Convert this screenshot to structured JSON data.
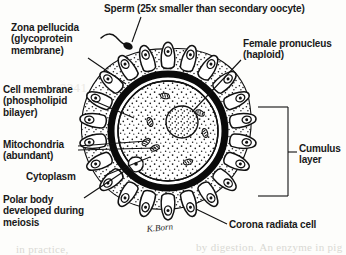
{
  "figure": {
    "background_color": "#fdfdfb",
    "ink_color": "#191919",
    "signature": "K.Born"
  },
  "labels": {
    "sperm": "Sperm (25x smaller than secondary oocyte)",
    "zona_pellucida": "Zona pellucida\n(glycoprotein\nmembrane)",
    "female_pronucleus": "Female pronucleus\n(haploid)",
    "cell_membrane": "Cell membrane\n(phospholipid\nbilayer)",
    "mitochondria": "Mitochondria\n(abundant)",
    "cytoplasm": "Cytoplasm",
    "polar_body": "Polar body\ndeveloped during\nmeiosis",
    "cumulus_layer": "Cumulus\nlayer",
    "corona_radiata": "Corona radiata cell"
  },
  "bleed_through": {
    "line_a": "in practice,",
    "line_b": "by digestion. An enzyme in pig the C4C 2005",
    "line_c": "2241"
  },
  "structures": {
    "zona_pellucida": {
      "shape": "thick-black-ring",
      "center": [
        168,
        131
      ],
      "radius": 58,
      "stroke_width": 6
    },
    "cell_membrane": {
      "shape": "thin-circle",
      "center": [
        168,
        131
      ],
      "radius": 50
    },
    "cytoplasm": {
      "shape": "stippled-disc",
      "center": [
        168,
        131
      ],
      "radius": 49
    },
    "female_pronucleus": {
      "shape": "stippled-circle",
      "center": [
        181,
        122
      ],
      "radius": 16
    },
    "mitochondria": {
      "shape": "small-oval-count",
      "count": 6
    },
    "polar_body": {
      "shape": "small-oval",
      "center": [
        139,
        166
      ]
    },
    "corona_radiata": {
      "shape": "columnar-cell-ring",
      "count": 22
    },
    "cumulus_layer": {
      "shape": "stippled-outer-layer"
    },
    "sperm": {
      "shape": "head-with-flagellum",
      "position": [
        127,
        44
      ]
    }
  }
}
